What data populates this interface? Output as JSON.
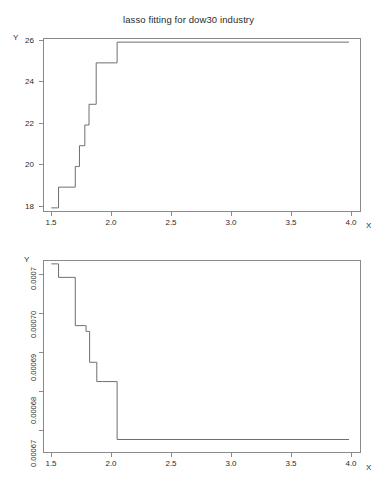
{
  "figure": {
    "title": "lasso fitting for dow30 industry",
    "background": "#ffffff",
    "line_color": "#6e6e6e",
    "axis_color": "#8a8a8a",
    "text_color": "#2b2b2b"
  },
  "axis_names": {
    "y": "Y",
    "x": "X"
  },
  "chart_data": [
    {
      "type": "line",
      "title": "lasso fitting for dow30 industry",
      "subtitle": "",
      "xlabel": "X",
      "ylabel": "Y",
      "xlim": [
        1.43,
        4.09
      ],
      "ylim": [
        17.8,
        26.2
      ],
      "xticks": [
        1.5,
        2.0,
        2.5,
        3.0,
        3.5,
        4.0
      ],
      "xtick_labels": [
        "1.5",
        "2.0",
        "2.5",
        "3.0",
        "3.5",
        "4.0"
      ],
      "yticks": [
        18,
        20,
        22,
        24,
        26
      ],
      "ytick_labels": [
        "18",
        "20",
        "22",
        "24",
        "26"
      ],
      "grid": false,
      "legend": null,
      "step": "hv",
      "series": [
        {
          "name": "number of selected variables",
          "x": [
            1.5,
            1.55,
            1.56,
            1.68,
            1.7,
            1.72,
            1.735,
            1.755,
            1.78,
            1.8,
            1.815,
            1.86,
            1.875,
            1.9,
            2.035,
            2.05,
            3.99
          ],
          "values": [
            18,
            18,
            19,
            19,
            20,
            20,
            21,
            21,
            22,
            22,
            23,
            23,
            25,
            25,
            25,
            26,
            26
          ]
        }
      ]
    },
    {
      "type": "line",
      "title": "",
      "subtitle": "",
      "xlabel": "X",
      "ylabel": "Y",
      "xlim": [
        1.43,
        4.09
      ],
      "ylim": [
        0.000663,
        0.000713
      ],
      "xticks": [
        1.5,
        2.0,
        2.5,
        3.0,
        3.5,
        4.0
      ],
      "xtick_labels": [
        "1.5",
        "2.0",
        "2.5",
        "3.0",
        "3.5",
        "4.0"
      ],
      "yticks": [
        0.00067,
        0.00068,
        0.00069,
        0.0007,
        0.00071
      ],
      "ytick_labels": [
        "0.00067",
        "0.00068",
        "0.00069",
        "0.00070",
        "0.0007"
      ],
      "grid": false,
      "legend": null,
      "step": "hv",
      "series": [
        {
          "name": "cross-validation error",
          "x": [
            1.5,
            1.55,
            1.56,
            1.68,
            1.7,
            1.775,
            1.79,
            1.805,
            1.82,
            1.865,
            1.88,
            1.93,
            2.04,
            2.05,
            3.99
          ],
          "values": [
            0.000712,
            0.000712,
            0.0007085,
            0.0007085,
            0.000696,
            0.000696,
            0.0006945,
            0.0006945,
            0.0006865,
            0.0006865,
            0.0006815,
            0.0006815,
            0.0006815,
            0.0006665,
            0.0006665
          ]
        }
      ]
    }
  ]
}
